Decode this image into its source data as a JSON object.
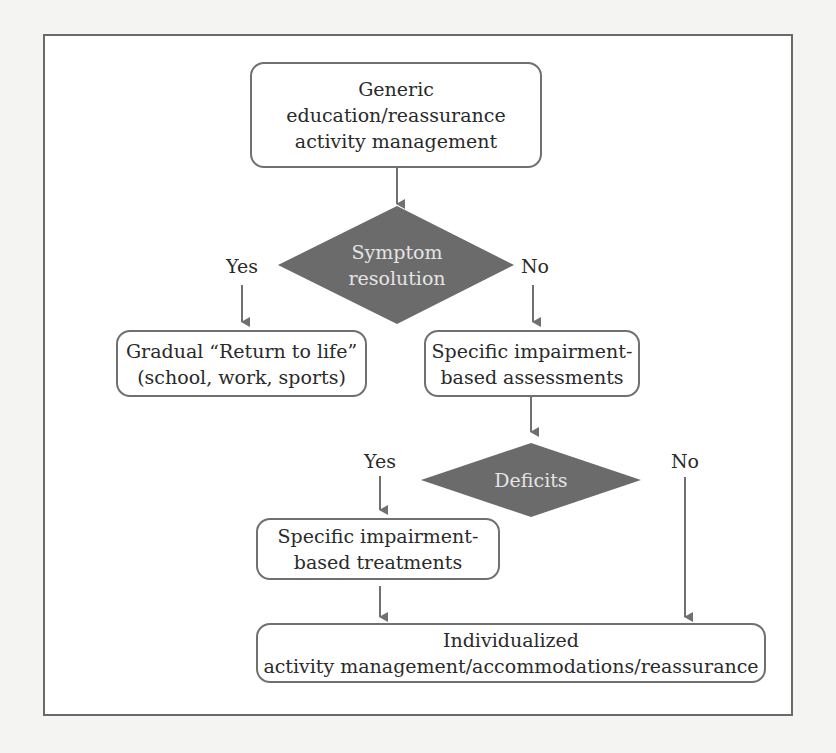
{
  "diagram": {
    "colors": {
      "box_border": "#707070",
      "decision_fill": "#6b6b6b",
      "decision_text": "#e4e4e4",
      "arrow": "#707070",
      "frame_border": "#6a6a6a"
    },
    "nodes": {
      "start": {
        "type": "process",
        "text": "Generic\neducation/reassurance\nactivity management"
      },
      "symptom_decision": {
        "type": "decision",
        "text": "Symptom\nresolution"
      },
      "return_to_life": {
        "type": "process",
        "text": "Gradual “Return to life”\n(school, work, sports)"
      },
      "assessments": {
        "type": "process",
        "text": "Specific impairment-\nbased assessments"
      },
      "deficits_decision": {
        "type": "decision",
        "text": "Deficits"
      },
      "treatments": {
        "type": "process",
        "text": "Specific impairment-\nbased treatments"
      },
      "individualized": {
        "type": "process",
        "text": "Individualized\nactivity management/accommodations/reassurance"
      }
    },
    "edges": [
      {
        "from": "start",
        "to": "symptom_decision",
        "label": ""
      },
      {
        "from": "symptom_decision",
        "to": "return_to_life",
        "label": "Yes"
      },
      {
        "from": "symptom_decision",
        "to": "assessments",
        "label": "No"
      },
      {
        "from": "assessments",
        "to": "deficits_decision",
        "label": ""
      },
      {
        "from": "deficits_decision",
        "to": "treatments",
        "label": "Yes"
      },
      {
        "from": "deficits_decision",
        "to": "individualized",
        "label": "No"
      },
      {
        "from": "treatments",
        "to": "individualized",
        "label": ""
      }
    ],
    "labels": {
      "symptom_yes": "Yes",
      "symptom_no": "No",
      "deficits_yes": "Yes",
      "deficits_no": "No"
    }
  }
}
